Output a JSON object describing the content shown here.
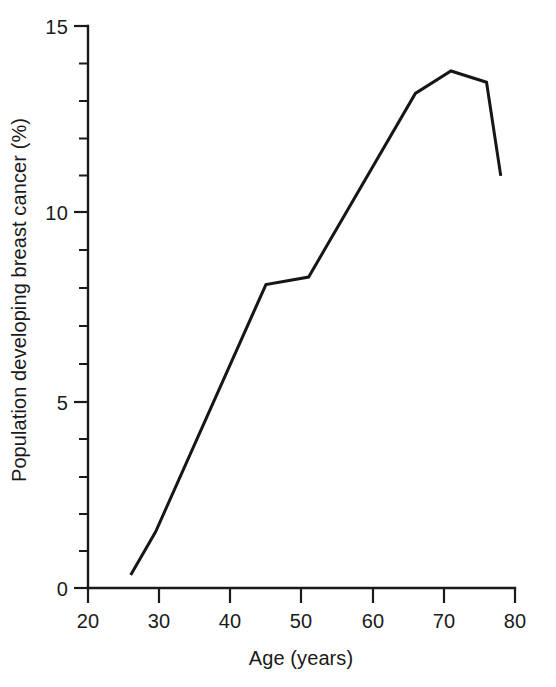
{
  "chart_data": {
    "type": "line",
    "title": "",
    "subtitle": "",
    "xlabel": "Age (years)",
    "ylabel": "Population developing breast cancer (%)",
    "xlim": [
      20,
      80
    ],
    "ylim": [
      0,
      15
    ],
    "grid": false,
    "legend": false,
    "legend_position": "none",
    "x_ticks_major": [
      20,
      30,
      40,
      50,
      60,
      70,
      80
    ],
    "x_tick_labels": [
      "20",
      "30",
      "40",
      "50",
      "60",
      "70",
      "80"
    ],
    "y_ticks_major": [
      0,
      5,
      10,
      15
    ],
    "y_tick_labels": [
      "0",
      "5",
      "10",
      "15"
    ],
    "y_ticks_minor": [
      1,
      2,
      3,
      4,
      6,
      7,
      8,
      9,
      11,
      12,
      13,
      14
    ],
    "x_minor_ticks": false,
    "line_color": "#161616",
    "series": [
      {
        "name": "Cumulative risk",
        "x": [
          26,
          29.5,
          45,
          51,
          66,
          71,
          76,
          78
        ],
        "y": [
          0.35,
          1.5,
          8.1,
          8.3,
          13.2,
          13.8,
          13.5,
          11.0
        ]
      }
    ]
  },
  "axis": {
    "x_title": "Age (years)",
    "y_title": "Population developing breast cancer (%)"
  },
  "ticks": {
    "x": [
      "20",
      "30",
      "40",
      "50",
      "60",
      "70",
      "80"
    ],
    "y": [
      "0",
      "5",
      "10",
      "15"
    ]
  },
  "colors": {
    "ink": "#1a1a1a",
    "line": "#161616",
    "background": "#ffffff"
  }
}
